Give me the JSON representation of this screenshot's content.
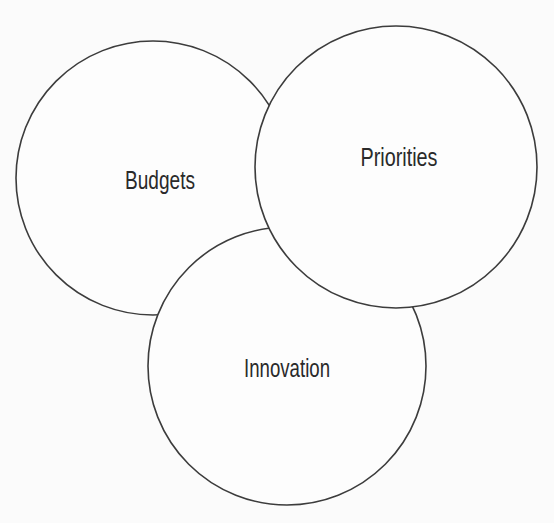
{
  "diagram": {
    "type": "overlapping-circles",
    "circles": [
      {
        "label": "Budgets"
      },
      {
        "label": "Priorities"
      },
      {
        "label": "Innovation"
      }
    ],
    "colors": {
      "background": "#fbfbfb",
      "circle_fill": "#fdfdfd",
      "circle_stroke": "#3c3c3c",
      "text": "#2a2a2a"
    }
  }
}
